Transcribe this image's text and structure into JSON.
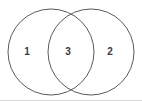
{
  "figure": {
    "kind": "venn-diagram",
    "title": "",
    "background_color": "#ffffff",
    "stroke_color": "#5a5a5a",
    "stroke_width": 1,
    "label_color": "#3a3a3a",
    "rule_color": "#dcdcdc"
  },
  "chart_data": {
    "type": "diagram",
    "diagram_type": "venn",
    "title": "",
    "xlabel": "",
    "ylabel": "",
    "sets": [
      {
        "name": "left-circle",
        "cx": 51,
        "cy": 52,
        "r": 43
      },
      {
        "name": "right-circle",
        "cx": 91,
        "cy": 52,
        "r": 43
      }
    ],
    "regions": [
      {
        "id": "left-only",
        "label": "1",
        "x": 27,
        "y": 52
      },
      {
        "id": "intersection",
        "label": "3",
        "x": 68,
        "y": 52
      },
      {
        "id": "right-only",
        "label": "2",
        "x": 110,
        "y": 52
      }
    ],
    "categories": [
      "left-only",
      "intersection",
      "right-only"
    ],
    "values": [
      1,
      3,
      2
    ],
    "legend": [],
    "annotations": [],
    "grid": false
  }
}
